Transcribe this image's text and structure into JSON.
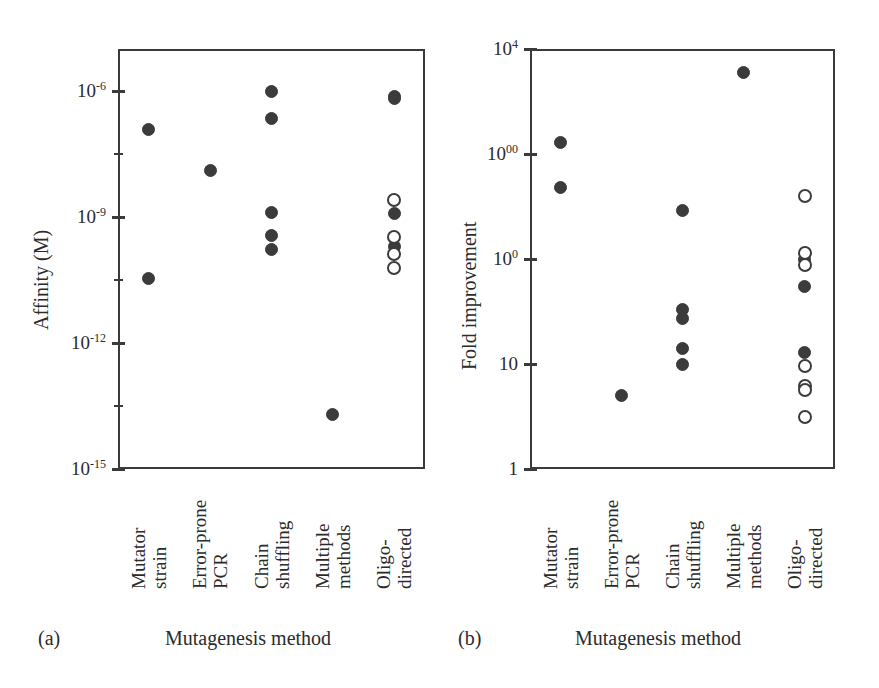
{
  "figure": {
    "panels": [
      {
        "letter": "(a)",
        "xlabel": "Mutagenesis method",
        "ylabel": "Affinity (M)"
      },
      {
        "letter": "(b)",
        "xlabel": "Mutagenesis method",
        "ylabel": "Fold improvement"
      }
    ],
    "categories": [
      [
        "Mutator",
        "strain"
      ],
      [
        "Error-prone",
        "PCR"
      ],
      [
        "Chain",
        "shuffling"
      ],
      [
        "Multiple",
        "methods"
      ],
      [
        "Oligo-",
        "directed"
      ]
    ]
  },
  "chart_data": [
    {
      "type": "scatter",
      "title": "",
      "panel": "(a)",
      "xlabel": "Mutagenesis method",
      "ylabel": "Affinity (M)",
      "yscale": "log",
      "ylim": [
        1e-15,
        1e-05
      ],
      "ytick_labels": [
        "10⁻⁶",
        "10⁻⁹",
        "10⁻¹²",
        "10⁻¹⁵"
      ],
      "ytick_values": [
        1e-06,
        1e-09,
        1e-12,
        1e-15
      ],
      "minor_ticks": "half-decade",
      "grid": false,
      "legend": "none",
      "categories": [
        "Mutator strain",
        "Error-prone PCR",
        "Chain shuffling",
        "Multiple methods",
        "Oligo-directed"
      ],
      "series": [
        {
          "name": "filled",
          "marker": "filled-circle",
          "points": [
            {
              "category": "Mutator strain",
              "value": 1.2e-07
            },
            {
              "category": "Mutator strain",
              "value": 3.5e-11
            },
            {
              "category": "Error-prone PCR",
              "value": 1.3e-08
            },
            {
              "category": "Chain shuffling",
              "value": 1e-06
            },
            {
              "category": "Chain shuffling",
              "value": 2.2e-07
            },
            {
              "category": "Chain shuffling",
              "value": 1.3e-09
            },
            {
              "category": "Chain shuffling",
              "value": 3.6e-10
            },
            {
              "category": "Chain shuffling",
              "value": 1.7e-10
            },
            {
              "category": "Multiple methods",
              "value": 2e-14
            },
            {
              "category": "Oligo-directed",
              "value": 7.5e-07
            },
            {
              "category": "Oligo-directed",
              "value": 6.5e-07
            },
            {
              "category": "Oligo-directed",
              "value": 1.2e-09
            },
            {
              "category": "Oligo-directed",
              "value": 2e-10
            }
          ]
        },
        {
          "name": "open",
          "marker": "open-circle",
          "points": [
            {
              "category": "Oligo-directed",
              "value": 2.6e-09
            },
            {
              "category": "Oligo-directed",
              "value": 3.4e-10
            },
            {
              "category": "Oligo-directed",
              "value": 1.3e-10
            },
            {
              "category": "Oligo-directed",
              "value": 6e-11
            }
          ]
        }
      ]
    },
    {
      "type": "scatter",
      "title": "",
      "panel": "(b)",
      "xlabel": "Mutagenesis method",
      "ylabel": "Fold improvement",
      "yscale": "log",
      "ylim": [
        1,
        10000
      ],
      "ytick_labels": [
        "10⁴",
        "1000",
        "100",
        "10",
        "1"
      ],
      "ytick_values": [
        10000,
        1000,
        100,
        10,
        1
      ],
      "grid": false,
      "legend": "none",
      "categories": [
        "Mutator strain",
        "Error-prone PCR",
        "Chain shuffling",
        "Multiple methods",
        "Oligo-directed"
      ],
      "series": [
        {
          "name": "filled",
          "marker": "filled-circle",
          "points": [
            {
              "category": "Mutator strain",
              "value": 1300
            },
            {
              "category": "Mutator strain",
              "value": 480
            },
            {
              "category": "Error-prone PCR",
              "value": 5
            },
            {
              "category": "Chain shuffling",
              "value": 290
            },
            {
              "category": "Chain shuffling",
              "value": 33
            },
            {
              "category": "Chain shuffling",
              "value": 27
            },
            {
              "category": "Chain shuffling",
              "value": 14
            },
            {
              "category": "Chain shuffling",
              "value": 9.8
            },
            {
              "category": "Multiple methods",
              "value": 6000
            },
            {
              "category": "Oligo-directed",
              "value": 100
            },
            {
              "category": "Oligo-directed",
              "value": 55
            },
            {
              "category": "Oligo-directed",
              "value": 13
            }
          ]
        },
        {
          "name": "open",
          "marker": "open-circle",
          "points": [
            {
              "category": "Oligo-directed",
              "value": 400
            },
            {
              "category": "Oligo-directed",
              "value": 115
            },
            {
              "category": "Oligo-directed",
              "value": 88
            },
            {
              "category": "Oligo-directed",
              "value": 9.5
            },
            {
              "category": "Oligo-directed",
              "value": 6.2
            },
            {
              "category": "Oligo-directed",
              "value": 5.6
            },
            {
              "category": "Oligo-directed",
              "value": 3.1
            }
          ]
        }
      ]
    }
  ]
}
